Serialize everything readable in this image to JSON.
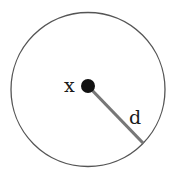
{
  "diagram": {
    "type": "circle-radius",
    "circle": {
      "cx": 88,
      "cy": 89.5,
      "r": 77,
      "stroke": "#555555",
      "stroke_width": 1.3
    },
    "center_point": {
      "label": "x",
      "cx": 88,
      "cy": 86,
      "r": 7,
      "fill": "#111111"
    },
    "radius_line": {
      "label": "d",
      "x1": 88,
      "y1": 86,
      "x2": 143,
      "y2": 143,
      "stroke": "#777777",
      "stroke_width": 3.2
    },
    "labels": {
      "center": "x",
      "distance": "d"
    }
  }
}
